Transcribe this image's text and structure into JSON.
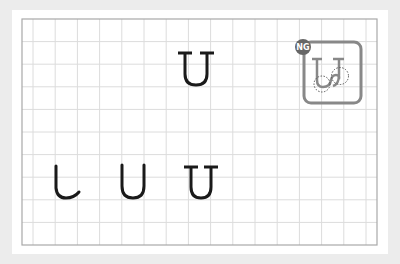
{
  "worksheet": {
    "type": "handwriting-practice-grid",
    "colors": {
      "background": "#ececec",
      "paper": "#ffffff",
      "grid_line": "#d6d6d6",
      "grid_border": "#a8a8a8",
      "stroke": "#1a1a1a",
      "ng_box": "#888888",
      "ng_badge": "#666666"
    },
    "model_character": {
      "glyph": "U",
      "style": "serif-topped"
    },
    "practice_steps": [
      {
        "step": 1,
        "description": "left stroke with bottom curve"
      },
      {
        "step": 2,
        "description": "U without serifs"
      },
      {
        "step": 3,
        "description": "U with top serifs"
      }
    ],
    "ng_example": {
      "badge_label": "NG",
      "description": "incorrect U with looped bottom corners (dashed circles mark errors)"
    }
  }
}
